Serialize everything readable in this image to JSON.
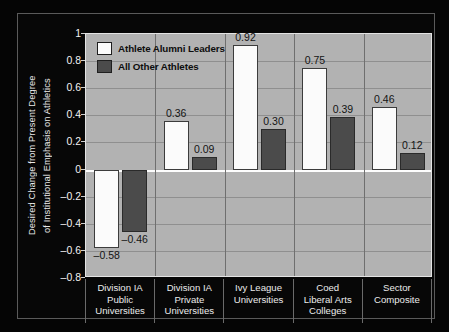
{
  "chart_data": {
    "type": "bar",
    "title": "",
    "xlabel": "",
    "ylabel": "Desired Change from Present Degree of Institutional Emphasis on Athletics",
    "ylabel_lines": [
      "Desired Change from Present Degree",
      "of Institutional Emphasis on Athletics"
    ],
    "categories": [
      "Division IA Public Universities",
      "Division IA Private Universities",
      "Ivy League Universities",
      "Coed Liberal Arts Colleges",
      "Sector Composite"
    ],
    "category_lines": [
      [
        "Division IA",
        "Public",
        "Universities"
      ],
      [
        "Division IA",
        "Private",
        "Universities"
      ],
      [
        "Ivy League",
        "Universities"
      ],
      [
        "Coed",
        "Liberal Arts",
        "Colleges"
      ],
      [
        "Sector",
        "Composite"
      ]
    ],
    "series": [
      {
        "name": "Athlete Alumni Leaders",
        "color": "#fcfcfc",
        "values": [
          -0.58,
          0.36,
          0.92,
          0.75,
          0.46
        ],
        "labels": [
          "–0.58",
          "0.36",
          "0.92",
          "0.75",
          "0.46"
        ]
      },
      {
        "name": "All Other Athletes",
        "color": "#4b4b4b",
        "values": [
          -0.46,
          0.09,
          0.3,
          0.39,
          0.12
        ],
        "labels": [
          "–0.46",
          "0.09",
          "0.30",
          "0.39",
          "0.12"
        ]
      }
    ],
    "ylim": [
      -0.8,
      1.0
    ],
    "yticks": [
      1,
      0.8,
      0.6,
      0.4,
      0.2,
      0,
      -0.2,
      -0.4,
      -0.6,
      -0.8
    ],
    "ytick_labels": [
      "1",
      "0.8",
      "0.6",
      "0.4",
      "0.2",
      "0",
      "–0.2",
      "–0.4",
      "–0.6",
      "–0.8"
    ],
    "grid": true,
    "zero_line": true,
    "legend_position": "top-left-inside",
    "colors": {
      "figure_background": "#060606",
      "plot_background": "#b2b2b2",
      "gridline": "#8f8f8f",
      "zero_line": "#fdfdfd",
      "separator": "#6f6f6f",
      "axis_text": "#ececec",
      "value_text": "#141414"
    }
  }
}
